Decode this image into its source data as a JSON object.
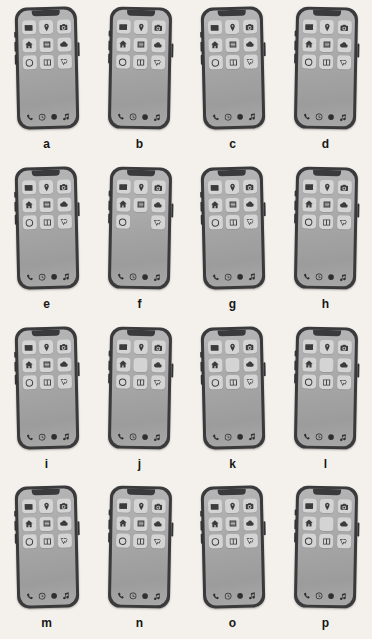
{
  "page": {
    "background_color": "#f4f1ec",
    "columns": 4,
    "rows": 4
  },
  "colors": {
    "frame": "#3a3a3c",
    "screen_top": "#b5b5b5",
    "screen_bottom": "#a8a8a8",
    "app_tile": "#d4d4d4",
    "glyph": "#3c3c3e",
    "label": "#171717"
  },
  "icon_legend": {
    "envelope": "envelope-icon",
    "pin": "location-pin-icon",
    "camera": "camera-icon",
    "home": "home-icon",
    "list": "list-icon",
    "cloud": "cloud-icon",
    "circle": "circle-outline-icon",
    "book": "book-icon",
    "chart": "chart-zigzag-icon",
    "blank": "blank-tile",
    "phone": "phone-handset-icon",
    "clock": "clock-icon",
    "dot": "filled-circle-icon",
    "music": "music-note-icon"
  },
  "dock": [
    "phone",
    "clock",
    "dot",
    "music"
  ],
  "phones": [
    {
      "label": "a",
      "tilt": "l",
      "apps": [
        "envelope",
        "pin",
        "camera",
        "home",
        "list",
        "cloud",
        "circle",
        "book",
        "chart"
      ]
    },
    {
      "label": "b",
      "tilt": "r",
      "apps": [
        "envelope",
        "pin",
        "camera",
        "home",
        "list",
        "cloud",
        "circle",
        "book",
        "chart"
      ]
    },
    {
      "label": "c",
      "tilt": "l",
      "apps": [
        "envelope",
        "pin",
        "camera",
        "home",
        "list",
        "cloud",
        "circle",
        "book",
        "chart"
      ]
    },
    {
      "label": "d",
      "tilt": "r",
      "apps": [
        "envelope",
        "pin",
        "camera",
        "home",
        "list",
        "cloud",
        "circle",
        "book",
        "chart"
      ]
    },
    {
      "label": "e",
      "tilt": "l",
      "apps": [
        "envelope",
        "pin",
        "camera",
        "home",
        "list",
        "cloud",
        "circle",
        "book",
        "chart"
      ]
    },
    {
      "label": "f",
      "tilt": "r",
      "apps": [
        "envelope",
        "pin",
        "camera",
        "home",
        "list",
        "cloud",
        "circle",
        "gone",
        "chart"
      ]
    },
    {
      "label": "g",
      "tilt": "l",
      "apps": [
        "envelope",
        "pin",
        "camera",
        "home",
        "list",
        "cloud",
        "circle",
        "book",
        "chart"
      ]
    },
    {
      "label": "h",
      "tilt": "r",
      "apps": [
        "envelope",
        "pin",
        "camera",
        "home",
        "list",
        "cloud",
        "circle",
        "book",
        "chart"
      ]
    },
    {
      "label": "i",
      "tilt": "l",
      "apps": [
        "envelope",
        "pin",
        "camera",
        "home",
        "list",
        "cloud",
        "circle",
        "book",
        "chart"
      ]
    },
    {
      "label": "j",
      "tilt": "r",
      "apps": [
        "envelope",
        "pin",
        "camera",
        "home",
        "blank",
        "cloud",
        "circle",
        "book",
        "chart"
      ]
    },
    {
      "label": "k",
      "tilt": "l",
      "apps": [
        "envelope",
        "pin",
        "camera",
        "home",
        "blank",
        "cloud",
        "circle",
        "book",
        "chart"
      ]
    },
    {
      "label": "l",
      "tilt": "r",
      "apps": [
        "envelope",
        "pin",
        "camera",
        "home",
        "blank",
        "cloud",
        "circle",
        "book",
        "chart"
      ]
    },
    {
      "label": "m",
      "tilt": "l",
      "apps": [
        "envelope",
        "pin",
        "camera",
        "home",
        "list",
        "cloud",
        "circle",
        "book",
        "chart"
      ]
    },
    {
      "label": "n",
      "tilt": "r",
      "apps": [
        "envelope",
        "pin",
        "camera",
        "home",
        "list",
        "cloud",
        "circle",
        "book",
        "chart"
      ]
    },
    {
      "label": "o",
      "tilt": "l",
      "apps": [
        "envelope",
        "pin",
        "camera",
        "home",
        "list",
        "cloud",
        "circle",
        "book",
        "chart"
      ]
    },
    {
      "label": "p",
      "tilt": "r",
      "apps": [
        "envelope",
        "pin",
        "camera",
        "home",
        "blank",
        "cloud",
        "circle",
        "book",
        "chart"
      ]
    }
  ]
}
